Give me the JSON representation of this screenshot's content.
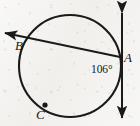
{
  "figure": {
    "kind": "circle-tangent-secant-diagram",
    "background_color": "#f1f0ed",
    "ink_color": "#1a1a1a",
    "width": 140,
    "height": 126,
    "circle": {
      "cx": 70,
      "cy": 66,
      "r": 51,
      "stroke_width": 2.1
    },
    "labels": {
      "point_a": "A",
      "point_b": "B",
      "point_c": "C",
      "angle": "106°"
    },
    "points": {
      "a": {
        "x": 120,
        "y": 57,
        "label_x": 124,
        "label_y": 53,
        "marked": false
      },
      "b": {
        "x": 25,
        "y": 42,
        "label_x": 16,
        "label_y": 40,
        "marked": false
      },
      "c": {
        "x": 45,
        "y": 105,
        "label_x": 36,
        "label_y": 108,
        "marked": true,
        "dot_r": 2.6
      }
    },
    "angle_mark": {
      "value": "106°",
      "label_x": 91,
      "label_y": 64,
      "vertex": "A"
    },
    "tangent_line": {
      "name": "tangent-at-a",
      "x1": 122,
      "y1": 13,
      "x2": 122,
      "y2": 118,
      "arrow_start": true,
      "arrow_end": true,
      "stroke_width": 2.0
    },
    "secant_line": {
      "name": "secant-through-a-and-b",
      "x1": 120,
      "y1": 57,
      "x2": 5,
      "y2": 33,
      "arrow_start": false,
      "arrow_end": true,
      "stroke_width": 2.0
    }
  }
}
